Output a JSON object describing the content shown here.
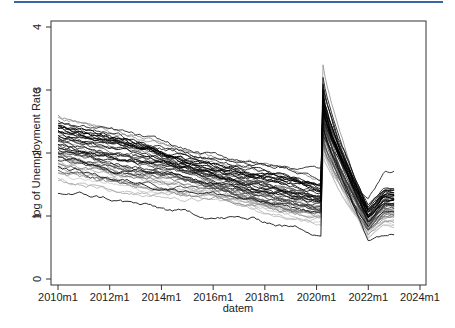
{
  "header": {
    "accent_color": "#3b64a8"
  },
  "chart_data": {
    "type": "line",
    "title": "",
    "xlabel": "datem",
    "ylabel": "log of Unemployment Rate",
    "xlim": [
      "2010m1",
      "2024m1"
    ],
    "ylim": [
      0,
      4
    ],
    "x_ticks": [
      "2010m1",
      "2012m1",
      "2014m1",
      "2016m1",
      "2018m1",
      "2020m1",
      "2022m1",
      "2024m1"
    ],
    "y_ticks": [
      "0",
      "1",
      "2",
      "3",
      "4"
    ],
    "grid": false,
    "legend": "none",
    "x_range_of_data": [
      "2010m1",
      "2023m1"
    ],
    "series_summary": {
      "start_2010m1": {
        "min": 1.37,
        "max": 2.6
      },
      "pre_covid_2020m2": {
        "min": 0.75,
        "max": 1.75
      },
      "peak_2020m4": {
        "min": 1.9,
        "max": 3.4
      },
      "trough_2022m1": {
        "min": 0.65,
        "max": 1.3
      },
      "end_2023m1": {
        "min": 0.72,
        "max": 1.7
      }
    },
    "series": [
      {
        "name": "s1",
        "start": 2.6,
        "pre": 1.55,
        "peak": 2.9,
        "trough": 1.05,
        "end": 1.3,
        "shade": "#888888"
      },
      {
        "name": "s2",
        "start": 2.55,
        "pre": 1.45,
        "peak": 3.4,
        "trough": 1.1,
        "end": 1.35,
        "shade": "#999999"
      },
      {
        "name": "s3",
        "start": 2.5,
        "pre": 1.6,
        "peak": 2.7,
        "trough": 1.2,
        "end": 1.45,
        "shade": "#222222"
      },
      {
        "name": "s4",
        "start": 2.45,
        "pre": 1.35,
        "peak": 3.1,
        "trough": 1.0,
        "end": 1.35,
        "shade": "#111111"
      },
      {
        "name": "s5",
        "start": 2.42,
        "pre": 1.4,
        "peak": 2.8,
        "trough": 1.15,
        "end": 1.4,
        "shade": "#333333"
      },
      {
        "name": "s6",
        "start": 2.4,
        "pre": 1.3,
        "peak": 2.6,
        "trough": 0.95,
        "end": 1.2,
        "shade": "#555555"
      },
      {
        "name": "s7",
        "start": 2.38,
        "pre": 1.5,
        "peak": 3.0,
        "trough": 1.05,
        "end": 1.3,
        "shade": "#000000"
      },
      {
        "name": "s8",
        "start": 2.35,
        "pre": 1.25,
        "peak": 2.9,
        "trough": 0.9,
        "end": 1.15,
        "shade": "#444444"
      },
      {
        "name": "s9",
        "start": 2.32,
        "pre": 1.42,
        "peak": 2.5,
        "trough": 1.1,
        "end": 1.4,
        "shade": "#1a1a1a"
      },
      {
        "name": "s10",
        "start": 2.3,
        "pre": 1.2,
        "peak": 2.7,
        "trough": 0.85,
        "end": 1.1,
        "shade": "#777777"
      },
      {
        "name": "s11",
        "start": 2.28,
        "pre": 1.38,
        "peak": 2.8,
        "trough": 1.0,
        "end": 1.25,
        "shade": "#000000"
      },
      {
        "name": "s12",
        "start": 2.25,
        "pre": 1.28,
        "peak": 2.4,
        "trough": 0.95,
        "end": 1.3,
        "shade": "#666666"
      },
      {
        "name": "s13",
        "start": 2.22,
        "pre": 1.75,
        "peak": 2.3,
        "trough": 1.3,
        "end": 1.7,
        "shade": "#222222"
      },
      {
        "name": "s14",
        "start": 2.2,
        "pre": 1.32,
        "peak": 2.6,
        "trough": 1.05,
        "end": 1.3,
        "shade": "#333333"
      },
      {
        "name": "s15",
        "start": 2.18,
        "pre": 1.15,
        "peak": 2.5,
        "trough": 0.8,
        "end": 1.05,
        "shade": "#aaaaaa"
      },
      {
        "name": "s16",
        "start": 2.15,
        "pre": 1.22,
        "peak": 2.7,
        "trough": 0.9,
        "end": 1.2,
        "shade": "#111111"
      },
      {
        "name": "s17",
        "start": 2.12,
        "pre": 1.1,
        "peak": 2.4,
        "trough": 0.85,
        "end": 1.0,
        "shade": "#888888"
      },
      {
        "name": "s18",
        "start": 2.1,
        "pre": 1.3,
        "peak": 2.9,
        "trough": 1.0,
        "end": 1.35,
        "shade": "#000000"
      },
      {
        "name": "s19",
        "start": 2.08,
        "pre": 1.18,
        "peak": 2.2,
        "trough": 0.9,
        "end": 1.15,
        "shade": "#555555"
      },
      {
        "name": "s20",
        "start": 2.05,
        "pre": 1.05,
        "peak": 2.5,
        "trough": 0.75,
        "end": 0.95,
        "shade": "#bbbbbb"
      },
      {
        "name": "s21",
        "start": 2.02,
        "pre": 1.25,
        "peak": 2.6,
        "trough": 1.0,
        "end": 1.3,
        "shade": "#222222"
      },
      {
        "name": "s22",
        "start": 2.0,
        "pre": 1.12,
        "peak": 2.3,
        "trough": 0.85,
        "end": 1.1,
        "shade": "#444444"
      },
      {
        "name": "s23",
        "start": 1.98,
        "pre": 1.0,
        "peak": 2.4,
        "trough": 0.7,
        "end": 0.9,
        "shade": "#999999"
      },
      {
        "name": "s24",
        "start": 1.95,
        "pre": 1.2,
        "peak": 2.7,
        "trough": 0.95,
        "end": 1.25,
        "shade": "#000000"
      },
      {
        "name": "s25",
        "start": 1.92,
        "pre": 1.08,
        "peak": 2.2,
        "trough": 0.8,
        "end": 1.05,
        "shade": "#666666"
      },
      {
        "name": "s26",
        "start": 1.9,
        "pre": 0.95,
        "peak": 2.1,
        "trough": 0.7,
        "end": 0.85,
        "shade": "#cccccc"
      },
      {
        "name": "s27",
        "start": 1.88,
        "pre": 1.15,
        "peak": 2.5,
        "trough": 0.9,
        "end": 1.2,
        "shade": "#333333"
      },
      {
        "name": "s28",
        "start": 1.85,
        "pre": 1.02,
        "peak": 2.3,
        "trough": 0.75,
        "end": 1.0,
        "shade": "#777777"
      },
      {
        "name": "s29",
        "start": 1.82,
        "pre": 1.1,
        "peak": 2.0,
        "trough": 0.85,
        "end": 1.1,
        "shade": "#aaaaaa"
      },
      {
        "name": "s30",
        "start": 1.8,
        "pre": 0.9,
        "peak": 2.2,
        "trough": 0.68,
        "end": 0.85,
        "shade": "#bbbbbb"
      },
      {
        "name": "s31",
        "start": 1.78,
        "pre": 1.05,
        "peak": 2.4,
        "trough": 0.8,
        "end": 1.05,
        "shade": "#111111"
      },
      {
        "name": "s32",
        "start": 1.75,
        "pre": 0.98,
        "peak": 2.1,
        "trough": 0.72,
        "end": 0.95,
        "shade": "#999999"
      },
      {
        "name": "s33",
        "start": 1.72,
        "pre": 1.12,
        "peak": 2.6,
        "trough": 0.88,
        "end": 1.15,
        "shade": "#444444"
      },
      {
        "name": "s34",
        "start": 1.7,
        "pre": 0.92,
        "peak": 2.0,
        "trough": 0.7,
        "end": 0.88,
        "shade": "#cccccc"
      },
      {
        "name": "s35",
        "start": 1.68,
        "pre": 1.0,
        "peak": 2.3,
        "trough": 0.78,
        "end": 1.0,
        "shade": "#888888"
      },
      {
        "name": "s36",
        "start": 1.6,
        "pre": 0.95,
        "peak": 1.9,
        "trough": 0.72,
        "end": 0.92,
        "shade": "#bbbbbb"
      },
      {
        "name": "s37",
        "start": 1.58,
        "pre": 1.08,
        "peak": 2.2,
        "trough": 0.85,
        "end": 1.05,
        "shade": "#aaaaaa"
      },
      {
        "name": "s38",
        "start": 1.37,
        "pre": 0.75,
        "peak": 2.5,
        "trough": 0.65,
        "end": 0.72,
        "shade": "#111111"
      },
      {
        "name": "s39",
        "start": 2.48,
        "pre": 1.48,
        "peak": 3.2,
        "trough": 1.08,
        "end": 1.32,
        "shade": "#222222"
      },
      {
        "name": "s40",
        "start": 2.36,
        "pre": 1.36,
        "peak": 2.85,
        "trough": 1.02,
        "end": 1.28,
        "shade": "#000000"
      },
      {
        "name": "s41",
        "start": 2.26,
        "pre": 1.26,
        "peak": 2.55,
        "trough": 0.92,
        "end": 1.18,
        "shade": "#333333"
      },
      {
        "name": "s42",
        "start": 2.14,
        "pre": 1.16,
        "peak": 2.45,
        "trough": 0.86,
        "end": 1.12,
        "shade": "#555555"
      },
      {
        "name": "s43",
        "start": 2.06,
        "pre": 1.24,
        "peak": 2.75,
        "trough": 0.98,
        "end": 1.26,
        "shade": "#1a1a1a"
      },
      {
        "name": "s44",
        "start": 1.96,
        "pre": 1.04,
        "peak": 2.35,
        "trough": 0.78,
        "end": 1.02,
        "shade": "#777777"
      },
      {
        "name": "s45",
        "start": 2.34,
        "pre": 1.44,
        "peak": 2.65,
        "trough": 1.12,
        "end": 1.38,
        "shade": "#000000"
      },
      {
        "name": "s46",
        "start": 2.2,
        "pre": 1.34,
        "peak": 2.95,
        "trough": 1.06,
        "end": 1.34,
        "shade": "#222222"
      },
      {
        "name": "s47",
        "start": 1.86,
        "pre": 0.96,
        "peak": 2.15,
        "trough": 0.74,
        "end": 0.94,
        "shade": "#c4c4c4"
      },
      {
        "name": "s48",
        "start": 2.44,
        "pre": 1.52,
        "peak": 3.05,
        "trough": 1.14,
        "end": 1.42,
        "shade": "#111111"
      },
      {
        "name": "s49",
        "start": 2.02,
        "pre": 1.14,
        "peak": 2.55,
        "trough": 0.88,
        "end": 1.16,
        "shade": "#444444"
      },
      {
        "name": "s50",
        "start": 2.4,
        "pre": 1.4,
        "peak": 2.75,
        "trough": 1.1,
        "end": 1.36,
        "shade": "#000000"
      }
    ]
  }
}
